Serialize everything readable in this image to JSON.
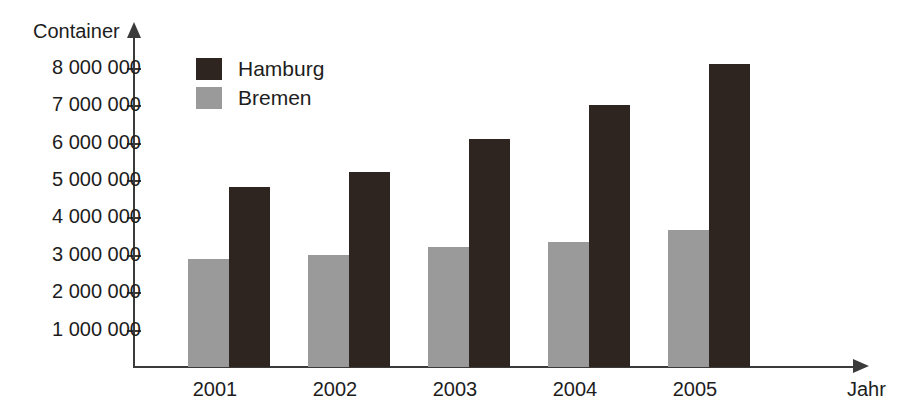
{
  "chart_data": {
    "type": "bar",
    "title": "",
    "xlabel": "Jahr",
    "ylabel": "Container",
    "categories": [
      "2001",
      "2002",
      "2003",
      "2004",
      "2005"
    ],
    "series": [
      {
        "name": "Hamburg",
        "color": "#2e2420",
        "values": [
          4800000,
          5200000,
          6100000,
          7000000,
          8100000
        ]
      },
      {
        "name": "Bremen",
        "color": "#9a9a9a",
        "values": [
          2900000,
          3000000,
          3200000,
          3350000,
          3650000
        ]
      }
    ],
    "ylim": [
      0,
      8900000
    ],
    "y_ticks": [
      {
        "value": 1000000,
        "label": "1 000 000"
      },
      {
        "value": 2000000,
        "label": "2 000 000"
      },
      {
        "value": 3000000,
        "label": "3 000 000"
      },
      {
        "value": 4000000,
        "label": "4 000 000"
      },
      {
        "value": 5000000,
        "label": "5 000 000"
      },
      {
        "value": 6000000,
        "label": "6 000 000"
      },
      {
        "value": 7000000,
        "label": "7 000 000"
      },
      {
        "value": 8000000,
        "label": "8 000 000"
      }
    ],
    "grid": false,
    "legend_position": "top-left-inside",
    "axis_color": "#3b3b3b",
    "text_color": "#1d1d1d",
    "background": "#ffffff"
  }
}
